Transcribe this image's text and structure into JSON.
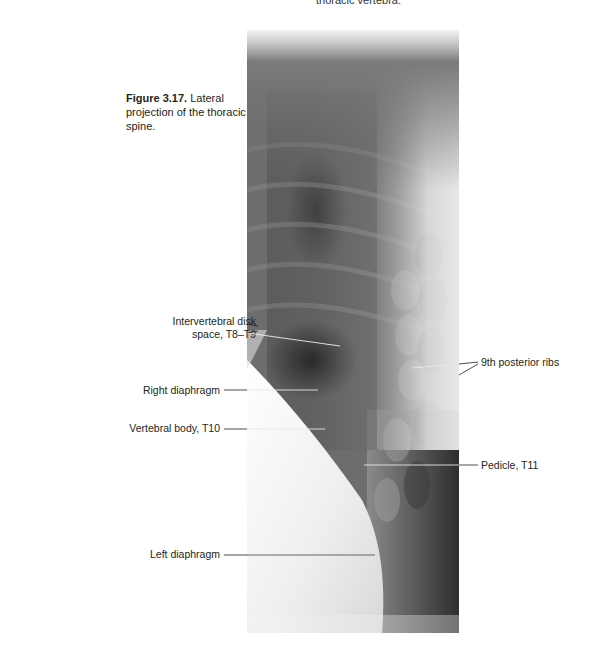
{
  "page": {
    "header_left": "",
    "header_right": "thoracic vertebra."
  },
  "figure": {
    "number": "Figure 3.17.",
    "caption": " Lateral projection of the thoracic spine.",
    "image_alt": "Lateral radiograph of the thoracic spine"
  },
  "labels": {
    "intervertebral_disk_line1": "Intervertebral disk",
    "intervertebral_disk_line2": "space, T8–T9",
    "right_diaphragm": "Right diaphragm",
    "vertebral_body": "Vertebral body, T10",
    "left_diaphragm": "Left diaphragm",
    "posterior_ribs": "9th posterior ribs",
    "pedicle": "Pedicle, T11"
  },
  "colors": {
    "text": "#231f20",
    "leader_line": "#231f20",
    "leader_line_on_image": "#e8e8e8"
  }
}
